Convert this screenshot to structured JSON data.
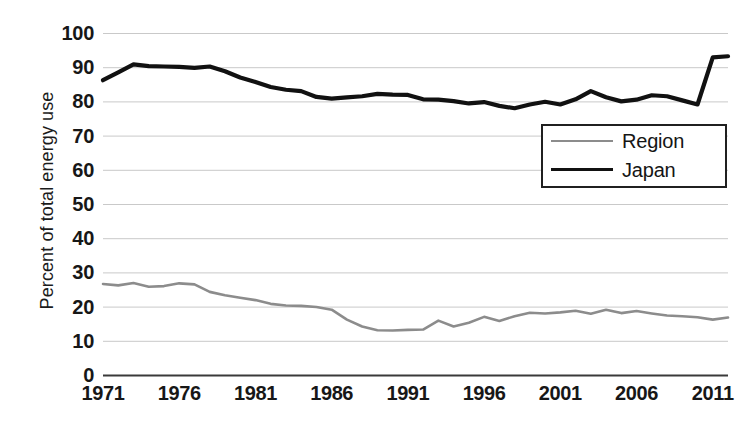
{
  "chart_data": {
    "type": "line",
    "title": "",
    "xlabel": "",
    "ylabel": "Percent of total energy use",
    "xlim": [
      1971,
      2012
    ],
    "ylim": [
      0,
      100
    ],
    "grid": true,
    "legend_position": "upper-right",
    "ytick_labels": [
      "100",
      "90",
      "80",
      "70",
      "60",
      "50",
      "40",
      "30",
      "20",
      "10",
      "0"
    ],
    "ytick_values": [
      100,
      90,
      80,
      70,
      60,
      50,
      40,
      30,
      20,
      10,
      0
    ],
    "xtick_labels": [
      "1971",
      "1976",
      "1981",
      "1986",
      "1991",
      "1996",
      "2001",
      "2006",
      "2011"
    ],
    "xtick_values": [
      1971,
      1976,
      1981,
      1986,
      1991,
      1996,
      2001,
      2006,
      2011
    ],
    "x": [
      1971,
      1972,
      1973,
      1974,
      1975,
      1976,
      1977,
      1978,
      1979,
      1980,
      1981,
      1982,
      1983,
      1984,
      1985,
      1986,
      1987,
      1988,
      1989,
      1990,
      1991,
      1992,
      1993,
      1994,
      1995,
      1996,
      1997,
      1998,
      1999,
      2000,
      2001,
      2002,
      2003,
      2004,
      2005,
      2006,
      2007,
      2008,
      2009,
      2010,
      2011,
      2012
    ],
    "series": [
      {
        "name": "Region",
        "color": "#8c8c8c",
        "width": 2.6,
        "values": [
          26.6,
          26.2,
          26.9,
          25.8,
          26.0,
          26.8,
          26.5,
          24.3,
          23.3,
          22.6,
          21.9,
          20.8,
          20.3,
          20.2,
          19.9,
          19.1,
          16.2,
          14.2,
          13.1,
          13.0,
          13.2,
          13.3,
          15.9,
          14.2,
          15.3,
          17.0,
          15.8,
          17.2,
          18.2,
          18.0,
          18.3,
          18.8,
          17.9,
          19.1,
          18.1,
          18.7,
          18.0,
          17.4,
          17.2,
          16.9,
          16.2,
          16.8
        ]
      },
      {
        "name": "Japan",
        "color": "#111111",
        "width": 4.2,
        "values": [
          86.2,
          88.5,
          90.8,
          90.3,
          90.2,
          90.1,
          89.8,
          90.2,
          88.8,
          87.0,
          85.7,
          84.2,
          83.4,
          83.0,
          81.3,
          80.8,
          81.2,
          81.5,
          82.2,
          82.0,
          81.9,
          80.6,
          80.5,
          80.1,
          79.4,
          79.8,
          78.7,
          78.0,
          79.1,
          79.9,
          79.1,
          80.6,
          83.0,
          81.2,
          80.0,
          80.5,
          81.8,
          81.5,
          80.3,
          79.1,
          92.9,
          93.2
        ]
      }
    ]
  },
  "legend": {
    "items": [
      {
        "label": "Region"
      },
      {
        "label": "Japan"
      }
    ]
  }
}
